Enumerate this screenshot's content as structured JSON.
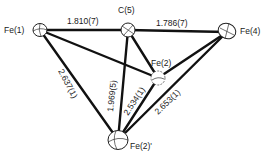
{
  "diagram": {
    "type": "molecular-structure",
    "atoms": [
      {
        "id": "fe1",
        "label": "Fe(1)"
      },
      {
        "id": "c5",
        "label": "C(5)"
      },
      {
        "id": "fe4",
        "label": "Fe(4)"
      },
      {
        "id": "fe2",
        "label": "Fe(2)"
      },
      {
        "id": "fe2p",
        "label": "Fe(2)'"
      }
    ],
    "bonds": [
      {
        "from": "fe1",
        "to": "c5",
        "length": "1.810(7)"
      },
      {
        "from": "c5",
        "to": "fe4",
        "length": "1.786(7)"
      },
      {
        "from": "fe1",
        "to": "fe2p",
        "length": "2.637(1)"
      },
      {
        "from": "c5",
        "to": "fe2p",
        "length": "1.969(5)"
      },
      {
        "from": "fe2",
        "to": "fe2p",
        "length": "2.534(1)"
      },
      {
        "from": "fe4",
        "to": "fe2p",
        "length": "2.653(1)"
      },
      {
        "from": "fe1",
        "to": "fe2",
        "length": ""
      },
      {
        "from": "c5",
        "to": "fe2",
        "length": ""
      },
      {
        "from": "fe4",
        "to": "fe2",
        "length": ""
      }
    ]
  }
}
